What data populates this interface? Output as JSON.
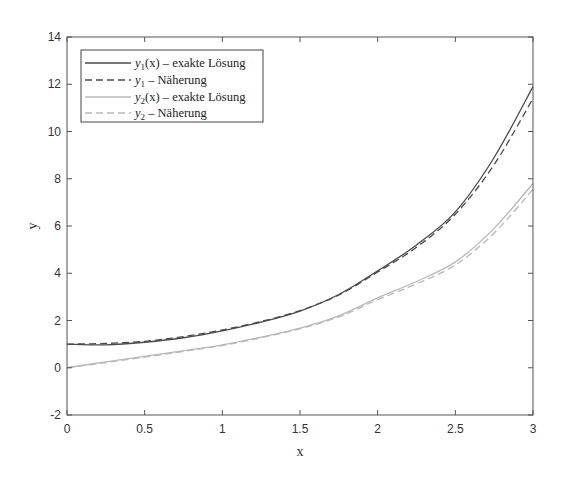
{
  "chart_data": {
    "type": "line",
    "title": "",
    "xlabel": "x",
    "ylabel": "y",
    "xlim": [
      0,
      3
    ],
    "ylim": [
      -2,
      14
    ],
    "grid": false,
    "legend_position": "upper left",
    "x_ticks": [
      "0",
      "0.5",
      "1",
      "1.5",
      "2",
      "2.5",
      "3"
    ],
    "y_ticks": [
      "-2",
      "0",
      "2",
      "4",
      "6",
      "8",
      "10",
      "12",
      "14"
    ],
    "x": [
      0,
      0.25,
      0.5,
      0.75,
      1,
      1.25,
      1.5,
      1.75,
      2,
      2.25,
      2.5,
      2.75,
      3
    ],
    "series": [
      {
        "name": "y1(x) – exakte Lösung",
        "legend_main": "y",
        "legend_sub": "1",
        "legend_rest": "(x) – exakte Lösung",
        "style": "solid",
        "color": "#4a4a4a",
        "values": [
          1.0,
          0.97,
          1.08,
          1.27,
          1.56,
          1.93,
          2.4,
          3.1,
          4.1,
          5.2,
          6.6,
          8.9,
          11.9
        ]
      },
      {
        "name": "y1 – Näherung",
        "legend_main": "y",
        "legend_sub": "1",
        "legend_rest": " – Näherung",
        "style": "dashed",
        "color": "#4a4a4a",
        "values": [
          1.0,
          1.03,
          1.12,
          1.32,
          1.6,
          1.96,
          2.42,
          3.08,
          4.05,
          5.1,
          6.5,
          8.6,
          11.4
        ]
      },
      {
        "name": "y2(x) – exakte Lösung",
        "legend_main": "y",
        "legend_sub": "2",
        "legend_rest": "(x) – exakte Lösung",
        "style": "solid",
        "color": "#b8b8b8",
        "values": [
          0.0,
          0.25,
          0.48,
          0.72,
          0.97,
          1.3,
          1.68,
          2.2,
          2.96,
          3.65,
          4.48,
          5.9,
          7.8
        ]
      },
      {
        "name": "y2 – Näherung",
        "legend_main": "y",
        "legend_sub": "2",
        "legend_rest": " – Näherung",
        "style": "dashed",
        "color": "#b8b8b8",
        "values": [
          0.0,
          0.22,
          0.45,
          0.69,
          0.94,
          1.27,
          1.65,
          2.15,
          2.88,
          3.55,
          4.35,
          5.7,
          7.55
        ]
      }
    ]
  }
}
